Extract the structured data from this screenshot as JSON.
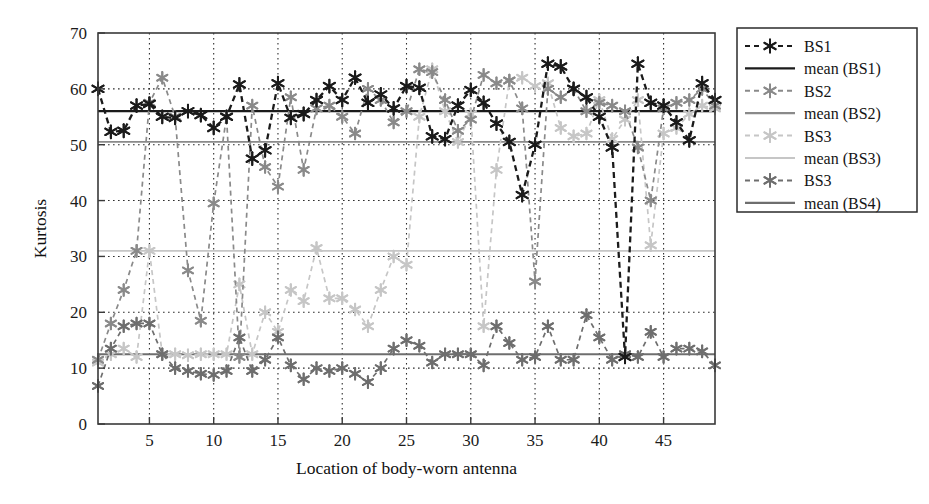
{
  "figure": {
    "title": "",
    "background_color": "#ffffff"
  },
  "chart_data": {
    "type": "line",
    "title": "",
    "xlabel": "Location of body-worn antenna",
    "ylabel": "Kurtosis",
    "xlim": [
      1,
      49
    ],
    "ylim": [
      0,
      70
    ],
    "xticks": [
      5,
      10,
      15,
      20,
      25,
      30,
      35,
      40,
      45
    ],
    "yticks": [
      0,
      10,
      20,
      30,
      40,
      50,
      60,
      70
    ],
    "grid": true,
    "legend_position": "outside-right",
    "marker": "asterisk",
    "x": [
      1,
      2,
      3,
      4,
      5,
      6,
      7,
      8,
      9,
      10,
      11,
      12,
      13,
      14,
      15,
      16,
      17,
      18,
      19,
      20,
      21,
      22,
      23,
      24,
      25,
      26,
      27,
      28,
      29,
      30,
      31,
      32,
      33,
      34,
      35,
      36,
      37,
      38,
      39,
      40,
      41,
      42,
      43,
      44,
      45,
      46,
      47,
      48,
      49
    ],
    "series": [
      {
        "name": "BS1",
        "color": "#1b1b1b",
        "style": "dashed-marker",
        "values": [
          60.0,
          52.3,
          52.5,
          57.0,
          57.3,
          55.0,
          54.8,
          56.0,
          55.3,
          53.0,
          55.0,
          60.8,
          47.5,
          49.0,
          61.0,
          54.8,
          55.5,
          58.0,
          60.5,
          58.0,
          62.0,
          57.5,
          59.0,
          56.5,
          60.5,
          60.2,
          51.5,
          51.0,
          57.0,
          59.8,
          57.5,
          53.8,
          50.5,
          41.0,
          50.0,
          64.5,
          64.0,
          60.0,
          58.5,
          55.0,
          49.5,
          12.0,
          64.5,
          57.5,
          57.0,
          54.0,
          50.8,
          61.0,
          58.0
        ]
      },
      {
        "name": "mean (BS1)",
        "color": "#1b1b1b",
        "style": "solid-line",
        "value": 56.0
      },
      {
        "name": "BS2",
        "color": "#8a8a8a",
        "style": "dashed-marker",
        "values": [
          11.5,
          18.0,
          24.0,
          31.0,
          57.5,
          62.0,
          55.0,
          27.5,
          18.5,
          39.5,
          55.0,
          12.0,
          57.0,
          46.0,
          42.5,
          58.5,
          45.5,
          56.5,
          57.0,
          55.0,
          52.0,
          60.0,
          58.0,
          54.0,
          56.0,
          63.5,
          63.0,
          58.0,
          52.5,
          54.5,
          62.5,
          61.0,
          61.5,
          56.5,
          25.5,
          60.0,
          58.5,
          60.0,
          56.0,
          57.5,
          57.0,
          56.0,
          49.5,
          40.0,
          56.5,
          57.5,
          58.0,
          60.0,
          57.0
        ]
      },
      {
        "name": "mean (BS2)",
        "color": "#8a8a8a",
        "style": "solid-line",
        "value": 50.5
      },
      {
        "name": "BS3",
        "color": "#c6c6c6",
        "style": "dashed-marker",
        "values": [
          11.0,
          12.5,
          13.5,
          12.0,
          31.0,
          12.5,
          12.5,
          12.3,
          12.5,
          12.5,
          12.5,
          25.0,
          12.5,
          20.0,
          16.5,
          24.0,
          22.0,
          31.5,
          22.5,
          22.5,
          20.5,
          17.5,
          24.0,
          30.0,
          28.5,
          55.0,
          63.5,
          56.0,
          50.5,
          55.5,
          17.5,
          45.5,
          61.5,
          62.0,
          60.5,
          61.0,
          53.0,
          51.5,
          52.0,
          58.0,
          51.0,
          54.5,
          58.0,
          32.0,
          52.0,
          53.0,
          55.5,
          57.0,
          56.5
        ]
      },
      {
        "name": "mean (BS3)",
        "color": "#c6c6c6",
        "style": "solid-line",
        "value": 31.0
      },
      {
        "name": "BS3",
        "color": "#6e6e6e",
        "style": "dashed-marker",
        "values": [
          6.8,
          13.5,
          17.5,
          18.0,
          18.0,
          12.5,
          10.0,
          9.5,
          9.0,
          8.8,
          9.5,
          15.5,
          9.5,
          11.5,
          15.5,
          10.5,
          8.0,
          10.0,
          9.5,
          10.0,
          9.0,
          7.5,
          10.0,
          13.5,
          15.0,
          14.0,
          11.0,
          12.5,
          12.5,
          12.5,
          10.5,
          17.5,
          14.5,
          11.5,
          12.0,
          17.5,
          11.5,
          11.5,
          19.5,
          15.5,
          11.5,
          12.5,
          12.0,
          16.5,
          12.0,
          13.5,
          13.5,
          13.0,
          10.5
        ]
      },
      {
        "name": "mean (BS4)",
        "color": "#6e6e6e",
        "style": "solid-line",
        "value": 12.5
      }
    ]
  },
  "legend": {
    "entries": [
      {
        "label": "BS1",
        "kind": "marker",
        "color": "#1b1b1b"
      },
      {
        "label": "mean (BS1)",
        "kind": "line",
        "color": "#1b1b1b"
      },
      {
        "label": "BS2",
        "kind": "marker",
        "color": "#8a8a8a"
      },
      {
        "label": "mean (BS2)",
        "kind": "line",
        "color": "#8a8a8a"
      },
      {
        "label": "BS3",
        "kind": "marker",
        "color": "#c6c6c6"
      },
      {
        "label": "mean (BS3)",
        "kind": "line",
        "color": "#c6c6c6"
      },
      {
        "label": "BS3",
        "kind": "marker",
        "color": "#6e6e6e"
      },
      {
        "label": "mean (BS4)",
        "kind": "line",
        "color": "#6e6e6e"
      }
    ]
  }
}
